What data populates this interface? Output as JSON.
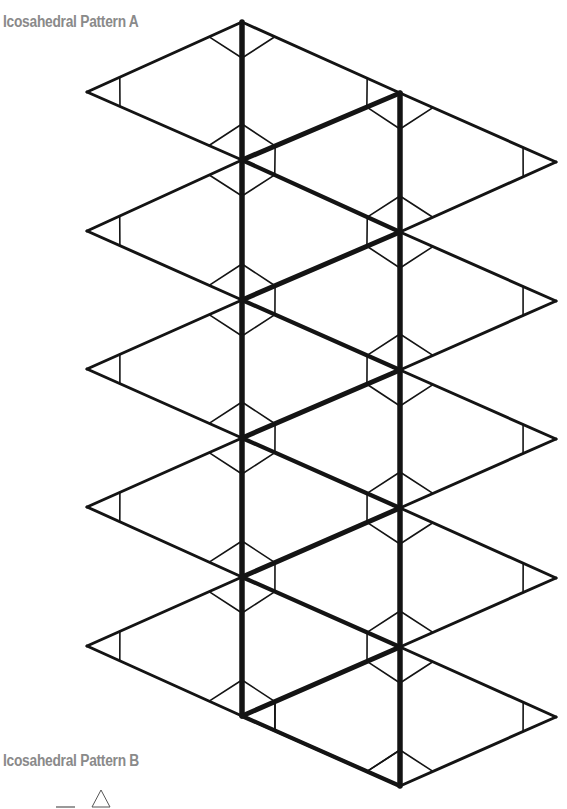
{
  "pattern_a": {
    "title": "Icosahedral Pattern A",
    "faces": 20,
    "spine_left_x": 242,
    "spine_right_x": 400,
    "left_spine_vertices_y": [
      22,
      160,
      300,
      438,
      577,
      716
    ],
    "right_spine_vertices_y": [
      93,
      232,
      370,
      508,
      647,
      786
    ],
    "left_tips": [
      [
        87,
        92
      ],
      [
        87,
        231
      ],
      [
        87,
        369
      ],
      [
        87,
        507
      ],
      [
        87,
        646
      ]
    ],
    "right_tips": [
      [
        556,
        162
      ],
      [
        556,
        301
      ],
      [
        556,
        439
      ],
      [
        556,
        578
      ],
      [
        556,
        717
      ]
    ],
    "line_color": "#141414"
  },
  "pattern_b": {
    "title": "Icosahedral Pattern B",
    "legend_icons": [
      "fold-line-icon",
      "triangle-icon"
    ]
  }
}
